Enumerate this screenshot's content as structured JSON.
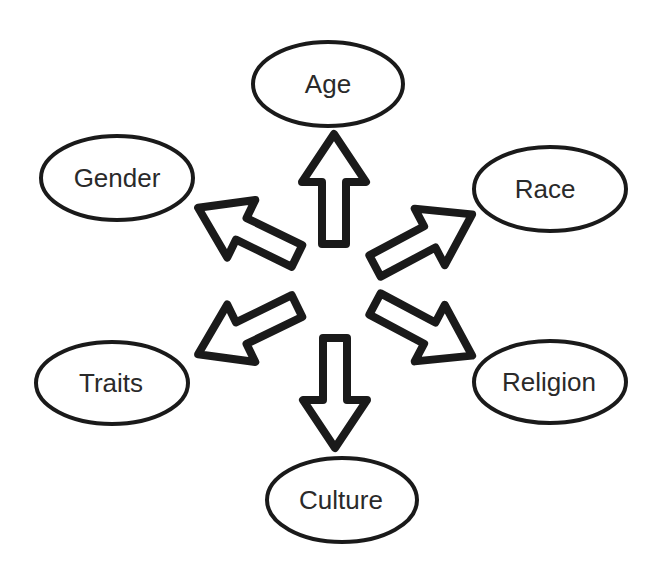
{
  "diagram": {
    "type": "radial-concept-map",
    "colors": {
      "stroke": "#1a1a1a",
      "text": "#2a2a2a",
      "background": "#ffffff",
      "fill": "#ffffff"
    },
    "center": {
      "x": 335,
      "y": 292
    },
    "nodes": [
      {
        "id": "age",
        "label": "Age",
        "cx": 328,
        "cy": 84,
        "rx": 77,
        "ry": 43,
        "direction": "up"
      },
      {
        "id": "gender",
        "label": "Gender",
        "cx": 117,
        "cy": 178,
        "rx": 77,
        "ry": 43,
        "direction": "upper-left"
      },
      {
        "id": "race",
        "label": "Race",
        "cx": 550,
        "cy": 189,
        "rx": 77,
        "ry": 43,
        "direction": "upper-right"
      },
      {
        "id": "traits",
        "label": "Traits",
        "cx": 112,
        "cy": 383,
        "rx": 77,
        "ry": 42,
        "direction": "lower-left"
      },
      {
        "id": "religion",
        "label": "Religion",
        "cx": 550,
        "cy": 382,
        "rx": 77,
        "ry": 42,
        "direction": "lower-right"
      },
      {
        "id": "culture",
        "label": "Culture",
        "cx": 342,
        "cy": 500,
        "rx": 76,
        "ry": 43,
        "direction": "down"
      }
    ],
    "arrows": [
      {
        "id": "arrow-age",
        "from": "center",
        "to": "age"
      },
      {
        "id": "arrow-gender",
        "from": "center",
        "to": "gender"
      },
      {
        "id": "arrow-race",
        "from": "center",
        "to": "race"
      },
      {
        "id": "arrow-traits",
        "from": "center",
        "to": "traits"
      },
      {
        "id": "arrow-religion",
        "from": "center",
        "to": "religion"
      },
      {
        "id": "arrow-culture",
        "from": "center",
        "to": "culture"
      }
    ]
  }
}
